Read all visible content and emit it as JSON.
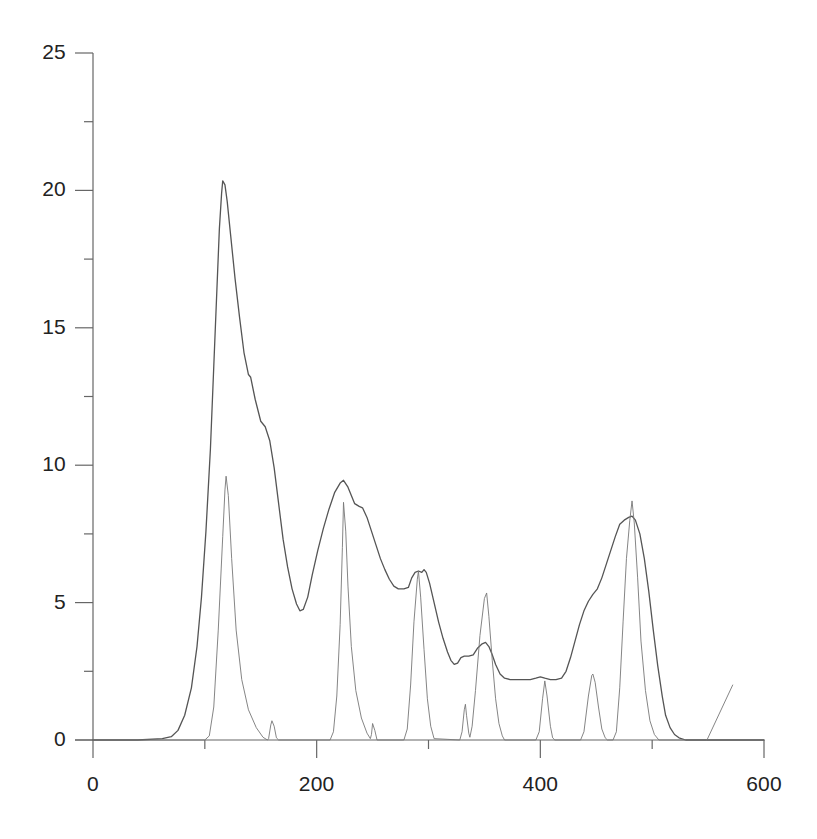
{
  "chart_data": {
    "type": "line",
    "title": "",
    "xlabel": "",
    "ylabel": "",
    "xlim": [
      0,
      600
    ],
    "ylim": [
      0,
      25
    ],
    "grid": false,
    "legend": "none",
    "x_ticks_major": [
      0,
      200,
      400,
      600
    ],
    "x_tick_labels": [
      "0",
      "200",
      "400",
      "600"
    ],
    "x_ticks_minor": [
      100,
      300,
      500
    ],
    "y_ticks_major": [
      0,
      5,
      10,
      15,
      20,
      25
    ],
    "y_tick_labels": [
      "0",
      "5",
      "10",
      "15",
      "20",
      "25"
    ],
    "y_ticks_minor": [
      2.5,
      7.5,
      12.5,
      17.5,
      22.5
    ],
    "series": [
      {
        "name": "smooth-envelope",
        "style": "solid",
        "color": "#555555",
        "width": 1.3,
        "points": [
          [
            0,
            0.0
          ],
          [
            40,
            0.0
          ],
          [
            62,
            0.05
          ],
          [
            70,
            0.12
          ],
          [
            76,
            0.35
          ],
          [
            82,
            0.9
          ],
          [
            88,
            1.9
          ],
          [
            93,
            3.4
          ],
          [
            97,
            5.2
          ],
          [
            101,
            7.6
          ],
          [
            105,
            10.6
          ],
          [
            108,
            13.6
          ],
          [
            111,
            16.6
          ],
          [
            113,
            18.6
          ],
          [
            115,
            19.9
          ],
          [
            116,
            20.35
          ],
          [
            118,
            20.2
          ],
          [
            120,
            19.6
          ],
          [
            123,
            18.4
          ],
          [
            127,
            16.8
          ],
          [
            131,
            15.4
          ],
          [
            135,
            14.1
          ],
          [
            139,
            13.3
          ],
          [
            141,
            13.2
          ],
          [
            145,
            12.4
          ],
          [
            150,
            11.6
          ],
          [
            154,
            11.4
          ],
          [
            158,
            10.9
          ],
          [
            162,
            9.9
          ],
          [
            166,
            8.6
          ],
          [
            170,
            7.3
          ],
          [
            174,
            6.3
          ],
          [
            178,
            5.5
          ],
          [
            182,
            4.95
          ],
          [
            185,
            4.7
          ],
          [
            188,
            4.75
          ],
          [
            192,
            5.2
          ],
          [
            196,
            6.0
          ],
          [
            201,
            6.9
          ],
          [
            206,
            7.7
          ],
          [
            211,
            8.4
          ],
          [
            216,
            9.0
          ],
          [
            221,
            9.35
          ],
          [
            224,
            9.45
          ],
          [
            228,
            9.2
          ],
          [
            231,
            8.9
          ],
          [
            234,
            8.6
          ],
          [
            238,
            8.5
          ],
          [
            241,
            8.45
          ],
          [
            245,
            8.1
          ],
          [
            249,
            7.6
          ],
          [
            253,
            7.1
          ],
          [
            257,
            6.6
          ],
          [
            261,
            6.2
          ],
          [
            265,
            5.85
          ],
          [
            269,
            5.6
          ],
          [
            273,
            5.5
          ],
          [
            278,
            5.5
          ],
          [
            282,
            5.55
          ],
          [
            285,
            5.9
          ],
          [
            288,
            6.1
          ],
          [
            291,
            6.15
          ],
          [
            294,
            6.1
          ],
          [
            296,
            6.2
          ],
          [
            298,
            6.1
          ],
          [
            301,
            5.7
          ],
          [
            305,
            5.0
          ],
          [
            309,
            4.3
          ],
          [
            313,
            3.7
          ],
          [
            317,
            3.2
          ],
          [
            320,
            2.9
          ],
          [
            323,
            2.75
          ],
          [
            326,
            2.8
          ],
          [
            329,
            3.0
          ],
          [
            332,
            3.05
          ],
          [
            336,
            3.05
          ],
          [
            340,
            3.1
          ],
          [
            344,
            3.35
          ],
          [
            348,
            3.5
          ],
          [
            351,
            3.55
          ],
          [
            354,
            3.4
          ],
          [
            357,
            3.1
          ],
          [
            360,
            2.75
          ],
          [
            364,
            2.4
          ],
          [
            368,
            2.25
          ],
          [
            373,
            2.2
          ],
          [
            379,
            2.2
          ],
          [
            385,
            2.2
          ],
          [
            391,
            2.2
          ],
          [
            396,
            2.25
          ],
          [
            400,
            2.3
          ],
          [
            404,
            2.25
          ],
          [
            409,
            2.2
          ],
          [
            414,
            2.2
          ],
          [
            419,
            2.25
          ],
          [
            423,
            2.5
          ],
          [
            427,
            3.0
          ],
          [
            431,
            3.6
          ],
          [
            435,
            4.2
          ],
          [
            439,
            4.7
          ],
          [
            443,
            5.05
          ],
          [
            447,
            5.3
          ],
          [
            451,
            5.5
          ],
          [
            455,
            5.9
          ],
          [
            459,
            6.4
          ],
          [
            463,
            6.9
          ],
          [
            467,
            7.4
          ],
          [
            471,
            7.85
          ],
          [
            475,
            8.0
          ],
          [
            479,
            8.1
          ],
          [
            482,
            8.15
          ],
          [
            485,
            8.0
          ],
          [
            489,
            7.5
          ],
          [
            493,
            6.6
          ],
          [
            497,
            5.4
          ],
          [
            501,
            4.0
          ],
          [
            505,
            2.7
          ],
          [
            509,
            1.6
          ],
          [
            512,
            0.9
          ],
          [
            516,
            0.45
          ],
          [
            520,
            0.2
          ],
          [
            524,
            0.08
          ],
          [
            530,
            0.0
          ],
          [
            600,
            0.0
          ]
        ]
      },
      {
        "name": "spike-peaks",
        "style": "solid",
        "color": "#777777",
        "width": 0.9,
        "points": [
          [
            0,
            0.0
          ],
          [
            100,
            0.0
          ],
          [
            104,
            0.15
          ],
          [
            108,
            1.2
          ],
          [
            112,
            4.0
          ],
          [
            116,
            7.4
          ],
          [
            118,
            9.1
          ],
          [
            119,
            9.6
          ],
          [
            121,
            8.9
          ],
          [
            124,
            6.6
          ],
          [
            128,
            4.0
          ],
          [
            133,
            2.2
          ],
          [
            139,
            1.1
          ],
          [
            146,
            0.45
          ],
          [
            152,
            0.1
          ],
          [
            156,
            0.0
          ],
          [
            157,
            0.05
          ],
          [
            159,
            0.55
          ],
          [
            160,
            0.7
          ],
          [
            162,
            0.5
          ],
          [
            164,
            0.08
          ],
          [
            166,
            0.0
          ],
          [
            212,
            0.0
          ],
          [
            215,
            0.3
          ],
          [
            218,
            1.6
          ],
          [
            221,
            4.2
          ],
          [
            223,
            7.0
          ],
          [
            224,
            8.65
          ],
          [
            226,
            7.6
          ],
          [
            228,
            5.6
          ],
          [
            231,
            3.4
          ],
          [
            235,
            1.8
          ],
          [
            240,
            0.8
          ],
          [
            245,
            0.25
          ],
          [
            248,
            0.05
          ],
          [
            249,
            0.2
          ],
          [
            250,
            0.6
          ],
          [
            252,
            0.35
          ],
          [
            254,
            0.0
          ],
          [
            278,
            0.0
          ],
          [
            281,
            0.4
          ],
          [
            284,
            2.0
          ],
          [
            287,
            4.3
          ],
          [
            290,
            5.85
          ],
          [
            291,
            6.15
          ],
          [
            293,
            5.2
          ],
          [
            296,
            3.3
          ],
          [
            299,
            1.5
          ],
          [
            302,
            0.5
          ],
          [
            305,
            0.05
          ],
          [
            328,
            0.0
          ],
          [
            330,
            0.3
          ],
          [
            332,
            1.1
          ],
          [
            333,
            1.3
          ],
          [
            334,
            0.9
          ],
          [
            336,
            0.25
          ],
          [
            337,
            0.1
          ],
          [
            339,
            0.5
          ],
          [
            342,
            1.8
          ],
          [
            346,
            3.8
          ],
          [
            350,
            5.15
          ],
          [
            352,
            5.35
          ],
          [
            354,
            4.5
          ],
          [
            357,
            2.9
          ],
          [
            360,
            1.5
          ],
          [
            363,
            0.6
          ],
          [
            366,
            0.15
          ],
          [
            368,
            0.0
          ],
          [
            396,
            0.0
          ],
          [
            399,
            0.3
          ],
          [
            402,
            1.5
          ],
          [
            404,
            2.15
          ],
          [
            406,
            1.6
          ],
          [
            409,
            0.5
          ],
          [
            411,
            0.08
          ],
          [
            413,
            0.0
          ],
          [
            436,
            0.0
          ],
          [
            439,
            0.3
          ],
          [
            443,
            1.6
          ],
          [
            446,
            2.35
          ],
          [
            447,
            2.4
          ],
          [
            449,
            2.1
          ],
          [
            452,
            1.2
          ],
          [
            455,
            0.4
          ],
          [
            458,
            0.08
          ],
          [
            460,
            0.0
          ],
          [
            465,
            0.0
          ],
          [
            468,
            0.3
          ],
          [
            471,
            1.9
          ],
          [
            474,
            4.3
          ],
          [
            477,
            6.6
          ],
          [
            480,
            8.0
          ],
          [
            482,
            8.7
          ],
          [
            484,
            7.9
          ],
          [
            487,
            5.9
          ],
          [
            490,
            3.6
          ],
          [
            494,
            1.8
          ],
          [
            498,
            0.7
          ],
          [
            502,
            0.2
          ],
          [
            506,
            0.0
          ],
          [
            600,
            0.0
          ]
        ]
      },
      {
        "name": "right-tail-segment",
        "style": "solid",
        "color": "#777777",
        "width": 0.9,
        "points": [
          [
            549,
            0.0
          ],
          [
            572,
            2.0
          ]
        ]
      }
    ],
    "annotations": [],
    "notable_peaks": [
      {
        "series": "smooth-envelope",
        "x": 116,
        "y": 20.35
      },
      {
        "series": "smooth-envelope",
        "x": 224,
        "y": 9.45
      },
      {
        "series": "smooth-envelope",
        "x": 291,
        "y": 6.15
      },
      {
        "series": "smooth-envelope",
        "x": 351,
        "y": 3.55
      },
      {
        "series": "smooth-envelope",
        "x": 482,
        "y": 8.15
      },
      {
        "series": "spike-peaks",
        "x": 119,
        "y": 9.6
      },
      {
        "series": "spike-peaks",
        "x": 224,
        "y": 8.65
      },
      {
        "series": "spike-peaks",
        "x": 291,
        "y": 6.15
      },
      {
        "series": "spike-peaks",
        "x": 352,
        "y": 5.35
      },
      {
        "series": "spike-peaks",
        "x": 482,
        "y": 8.7
      },
      {
        "series": "spike-peaks",
        "x": 160,
        "y": 0.7
      },
      {
        "series": "spike-peaks",
        "x": 250,
        "y": 0.6
      },
      {
        "series": "spike-peaks",
        "x": 333,
        "y": 1.3
      },
      {
        "series": "spike-peaks",
        "x": 404,
        "y": 2.15
      },
      {
        "series": "spike-peaks",
        "x": 447,
        "y": 2.4
      }
    ]
  },
  "axes": {
    "axis_color": "#666666",
    "plot_background": "#ffffff",
    "y_labels": [
      "25",
      "20",
      "15",
      "10",
      "5",
      "0"
    ],
    "x_labels": [
      "0",
      "200",
      "400",
      "600"
    ]
  }
}
